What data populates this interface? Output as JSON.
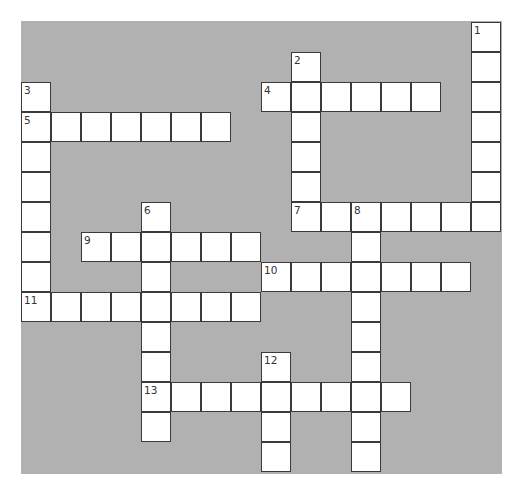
{
  "puzzle": {
    "grid": {
      "cols": 16,
      "rows": 15,
      "cell_size": 30,
      "origin_x": 21,
      "origin_y": 22
    },
    "colors": {
      "background": "#b1b1b1",
      "cell": "#ffffff",
      "border": "#3a3a3a"
    },
    "entries": [
      {
        "number": "1",
        "direction": "down",
        "row": 0,
        "col": 15,
        "length": 7
      },
      {
        "number": "2",
        "direction": "down",
        "row": 1,
        "col": 9,
        "length": 6
      },
      {
        "number": "3",
        "direction": "down",
        "row": 2,
        "col": 0,
        "length": 8
      },
      {
        "number": "4",
        "direction": "across",
        "row": 2,
        "col": 8,
        "length": 6
      },
      {
        "number": "5",
        "direction": "across",
        "row": 3,
        "col": 0,
        "length": 7
      },
      {
        "number": "6",
        "direction": "down",
        "row": 6,
        "col": 4,
        "length": 8
      },
      {
        "number": "7",
        "direction": "across",
        "row": 6,
        "col": 9,
        "length": 7
      },
      {
        "number": "8",
        "direction": "down",
        "row": 6,
        "col": 11,
        "length": 9
      },
      {
        "number": "9",
        "direction": "across",
        "row": 7,
        "col": 2,
        "length": 6
      },
      {
        "number": "10",
        "direction": "across",
        "row": 8,
        "col": 8,
        "length": 7
      },
      {
        "number": "11",
        "direction": "across",
        "row": 9,
        "col": 0,
        "length": 8
      },
      {
        "number": "12",
        "direction": "down",
        "row": 11,
        "col": 8,
        "length": 4
      },
      {
        "number": "13",
        "direction": "across",
        "row": 12,
        "col": 4,
        "length": 9
      }
    ]
  }
}
